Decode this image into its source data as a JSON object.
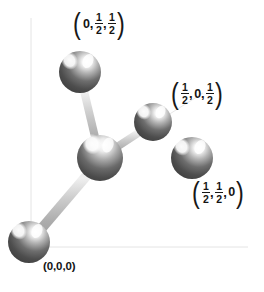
{
  "figure": {
    "kind": "crystal-structure-diagram",
    "background_color": "#ffffff",
    "width": 264,
    "height": 292
  },
  "axes": {
    "color": "#e2e2e2",
    "vertical": {
      "x": 31,
      "y1": 18,
      "y2": 247
    },
    "horizontal": {
      "y": 247,
      "x1": 31,
      "x2": 246
    },
    "diagonal_hint": {
      "x1": 200,
      "y1": 96,
      "x2": 100,
      "y2": 158
    }
  },
  "atoms": [
    {
      "id": "atom-center",
      "name": "central-atom",
      "label": null,
      "cx": 100,
      "cy": 158,
      "r": 23,
      "fill_dark": "#4e4e4e",
      "fill_light": "#9a9a9a"
    },
    {
      "id": "atom-0-half-half",
      "name": "atom-0-half-half",
      "label_id": "label-0-half-half",
      "cx": 80,
      "cy": 72,
      "r": 21,
      "fill_dark": "#4a4a4a",
      "fill_light": "#989898"
    },
    {
      "id": "atom-half-0-half",
      "name": "atom-half-0-half",
      "label_id": "label-half-0-half",
      "cx": 153,
      "cy": 122,
      "r": 19,
      "fill_dark": "#4a4a4a",
      "fill_light": "#989898"
    },
    {
      "id": "atom-half-half-0",
      "name": "atom-half-half-0",
      "label_id": "label-half-half-0",
      "cx": 192,
      "cy": 158,
      "r": 21,
      "fill_dark": "#4a4a4a",
      "fill_light": "#989898"
    },
    {
      "id": "atom-origin",
      "name": "atom-origin",
      "label_id": "label-origin",
      "cx": 29,
      "cy": 242,
      "r": 21,
      "fill_dark": "#4a4a4a",
      "fill_light": "#989898"
    }
  ],
  "bonds": [
    {
      "id": "bond-center-to-0-half-half",
      "from": "atom-center",
      "to": "atom-0-half-half",
      "thickness": 8,
      "color": "#c3c3c3"
    },
    {
      "id": "bond-center-to-half-0-half",
      "from": "atom-center",
      "to": "atom-half-0-half",
      "thickness": 8,
      "color": "#c3c3c3"
    },
    {
      "id": "bond-center-to-half-half-0",
      "from": "atom-center",
      "to": "atom-half-half-0",
      "thickness": 9,
      "color": "#c3c3c3"
    },
    {
      "id": "bond-center-to-origin",
      "from": "atom-center",
      "to": "atom-origin",
      "thickness": 9,
      "color": "#c3c3c3"
    }
  ],
  "labels": {
    "label_0_half_half": {
      "name": "coordinate-label-0-half-half",
      "text": "(0, 1/2, 1/2)",
      "terms": [
        "0",
        "1/2",
        "1/2"
      ],
      "x": 72,
      "y": 14
    },
    "label_half_0_half": {
      "name": "coordinate-label-half-0-half",
      "text": "(1/2, 0, 1/2)",
      "terms": [
        "1/2",
        "0",
        "1/2"
      ],
      "x": 170,
      "y": 84
    },
    "label_half_half_0": {
      "name": "coordinate-label-half-half-0",
      "text": "(1/2, 1/2, 0)",
      "terms": [
        "1/2",
        "1/2",
        "0"
      ],
      "x": 192,
      "y": 183
    },
    "label_origin": {
      "name": "coordinate-label-origin",
      "text": "(0,0,0)",
      "x": 43,
      "y": 262
    }
  },
  "caption_fragment": {
    "text": "",
    "visible": false
  }
}
